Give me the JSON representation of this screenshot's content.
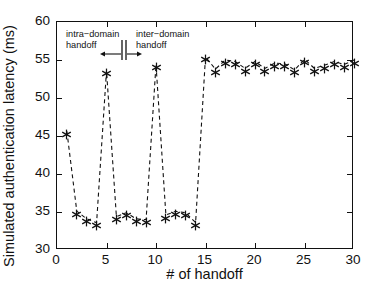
{
  "chart_data": {
    "type": "line",
    "title": "",
    "xlabel": "# of handoff",
    "ylabel": "Simulated authentication latency (ms)",
    "xlim": [
      0,
      30
    ],
    "ylim": [
      30,
      60
    ],
    "xticks": [
      0,
      5,
      10,
      15,
      20,
      25,
      30
    ],
    "yticks": [
      30,
      35,
      40,
      45,
      50,
      55,
      60
    ],
    "xtick_labels": [
      "0",
      "5",
      "10",
      "15",
      "20",
      "25",
      "30"
    ],
    "ytick_labels": [
      "30",
      "35",
      "40",
      "45",
      "50",
      "55",
      "60"
    ],
    "grid": false,
    "legend": null,
    "line_style": "dashed",
    "marker": "asterisk",
    "series_color": "#111111",
    "x": [
      1,
      2,
      3,
      4,
      5,
      6,
      7,
      8,
      9,
      10,
      11,
      12,
      13,
      14,
      15,
      16,
      17,
      18,
      19,
      20,
      21,
      22,
      23,
      24,
      25,
      26,
      27,
      28,
      29,
      30
    ],
    "values": [
      45.6,
      35.1,
      34.1,
      33.6,
      53.6,
      34.4,
      34.9,
      34.1,
      34.0,
      54.4,
      34.6,
      35.1,
      34.9,
      33.6,
      55.4,
      53.8,
      55.0,
      54.8,
      53.9,
      54.8,
      53.9,
      54.6,
      54.5,
      53.7,
      55.1,
      53.9,
      54.3,
      54.8,
      54.4,
      55.0
    ],
    "annotations": [
      {
        "name": "intra-domain",
        "line1": "intra−domain",
        "line2": "handoff"
      },
      {
        "name": "inter-domain",
        "line1": "inter−domain",
        "line2": "handoff"
      }
    ]
  }
}
